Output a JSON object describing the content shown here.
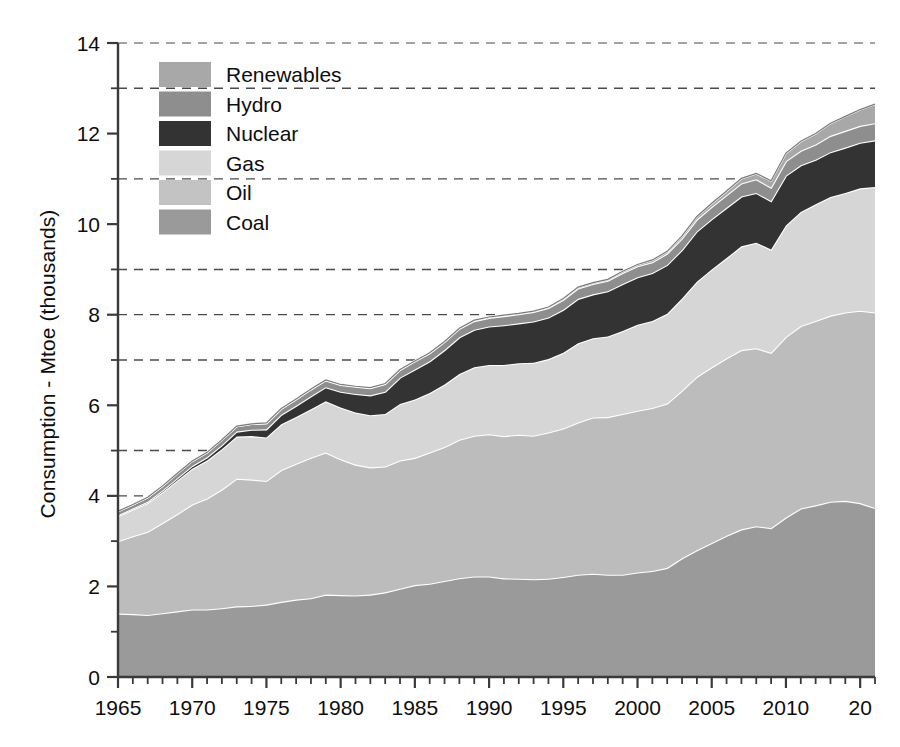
{
  "chart_data": {
    "type": "area",
    "stacked": true,
    "title": "",
    "subtitle": "",
    "xlabel": "",
    "ylabel": "Consumption - Mtoe (thousands)",
    "xlim": [
      1965,
      2016
    ],
    "ylim": [
      0,
      14
    ],
    "y_major_ticks": [
      0,
      2,
      4,
      6,
      8,
      10,
      12,
      14
    ],
    "y_minor_ticks": [
      1,
      3,
      5,
      7,
      9,
      11,
      13
    ],
    "y_tick_labels": [
      "0",
      "2",
      "4",
      "6",
      "8",
      "10",
      "12",
      "14"
    ],
    "x_tick_labels": [
      "1965",
      "1970",
      "1975",
      "1980",
      "1985",
      "1990",
      "1995",
      "2000",
      "2005",
      "2010",
      "20"
    ],
    "x_tick_values": [
      1965,
      1970,
      1975,
      1980,
      1985,
      1990,
      1995,
      2000,
      2005,
      2010,
      2015
    ],
    "x_minor_tick_step": 1,
    "grid": "horizontal-dashed-at-odd-values",
    "legend_position": "upper-left-inside",
    "series_order_bottom_to_top": [
      "Coal",
      "Oil",
      "Gas",
      "Nuclear",
      "Hydro",
      "Renewables"
    ],
    "x": [
      1965,
      1966,
      1967,
      1968,
      1969,
      1970,
      1971,
      1972,
      1973,
      1974,
      1975,
      1976,
      1977,
      1978,
      1979,
      1980,
      1981,
      1982,
      1983,
      1984,
      1985,
      1986,
      1987,
      1988,
      1989,
      1990,
      1991,
      1992,
      1993,
      1994,
      1995,
      1996,
      1997,
      1998,
      1999,
      2000,
      2001,
      2002,
      2003,
      2004,
      2005,
      2006,
      2007,
      2008,
      2009,
      2010,
      2011,
      2012,
      2013,
      2014,
      2015,
      2016
    ],
    "series": [
      {
        "name": "Coal",
        "color": "#9a9a9a",
        "values": [
          1.4,
          1.39,
          1.37,
          1.41,
          1.45,
          1.49,
          1.49,
          1.52,
          1.56,
          1.57,
          1.6,
          1.66,
          1.71,
          1.74,
          1.82,
          1.81,
          1.8,
          1.82,
          1.87,
          1.95,
          2.03,
          2.06,
          2.12,
          2.18,
          2.22,
          2.22,
          2.18,
          2.17,
          2.16,
          2.17,
          2.21,
          2.26,
          2.28,
          2.26,
          2.26,
          2.31,
          2.34,
          2.41,
          2.62,
          2.8,
          2.96,
          3.12,
          3.26,
          3.33,
          3.29,
          3.52,
          3.72,
          3.79,
          3.87,
          3.89,
          3.84,
          3.73
        ],
        "value_range_note": "Mtoe thousands"
      },
      {
        "name": "Oil",
        "color": "#bcbcbc",
        "values": [
          1.6,
          1.72,
          1.84,
          1.99,
          2.15,
          2.32,
          2.45,
          2.62,
          2.82,
          2.79,
          2.73,
          2.91,
          3.0,
          3.1,
          3.14,
          3.0,
          2.89,
          2.81,
          2.78,
          2.83,
          2.81,
          2.9,
          2.96,
          3.06,
          3.11,
          3.14,
          3.14,
          3.18,
          3.17,
          3.23,
          3.28,
          3.36,
          3.45,
          3.48,
          3.55,
          3.57,
          3.6,
          3.63,
          3.7,
          3.83,
          3.88,
          3.92,
          3.96,
          3.93,
          3.87,
          3.99,
          4.03,
          4.07,
          4.11,
          4.16,
          4.25,
          4.32
        ]
      },
      {
        "name": "Gas",
        "color": "#d6d6d6",
        "values": [
          0.55,
          0.59,
          0.63,
          0.68,
          0.74,
          0.79,
          0.84,
          0.89,
          0.93,
          0.96,
          0.96,
          1.01,
          1.03,
          1.07,
          1.13,
          1.14,
          1.15,
          1.15,
          1.16,
          1.25,
          1.29,
          1.31,
          1.38,
          1.45,
          1.51,
          1.53,
          1.57,
          1.58,
          1.61,
          1.62,
          1.67,
          1.75,
          1.75,
          1.78,
          1.83,
          1.9,
          1.92,
          1.98,
          2.04,
          2.1,
          2.16,
          2.21,
          2.29,
          2.33,
          2.28,
          2.46,
          2.52,
          2.58,
          2.62,
          2.64,
          2.7,
          2.77
        ]
      },
      {
        "name": "Nuclear",
        "color": "#333333",
        "values": [
          0.02,
          0.02,
          0.03,
          0.04,
          0.05,
          0.06,
          0.07,
          0.09,
          0.11,
          0.14,
          0.18,
          0.21,
          0.25,
          0.29,
          0.31,
          0.35,
          0.41,
          0.44,
          0.49,
          0.58,
          0.66,
          0.7,
          0.76,
          0.81,
          0.83,
          0.85,
          0.88,
          0.88,
          0.91,
          0.92,
          0.95,
          0.98,
          0.97,
          1.0,
          1.04,
          1.05,
          1.06,
          1.08,
          1.07,
          1.11,
          1.11,
          1.11,
          1.1,
          1.1,
          1.07,
          1.1,
          1.03,
          0.98,
          0.99,
          1.0,
          1.01,
          1.03
        ]
      },
      {
        "name": "Hydro",
        "color": "#8e8e8e",
        "values": [
          0.09,
          0.09,
          0.1,
          0.1,
          0.11,
          0.11,
          0.11,
          0.12,
          0.12,
          0.13,
          0.13,
          0.13,
          0.14,
          0.15,
          0.15,
          0.15,
          0.16,
          0.16,
          0.17,
          0.17,
          0.18,
          0.18,
          0.18,
          0.19,
          0.19,
          0.19,
          0.2,
          0.2,
          0.21,
          0.21,
          0.22,
          0.23,
          0.23,
          0.23,
          0.24,
          0.24,
          0.24,
          0.25,
          0.25,
          0.26,
          0.27,
          0.28,
          0.29,
          0.3,
          0.3,
          0.32,
          0.32,
          0.34,
          0.36,
          0.37,
          0.37,
          0.38
        ]
      },
      {
        "name": "Renewables",
        "color": "#a8a8a8",
        "values": [
          0.0,
          0.0,
          0.0,
          0.0,
          0.0,
          0.0,
          0.0,
          0.0,
          0.0,
          0.0,
          0.01,
          0.01,
          0.01,
          0.01,
          0.01,
          0.01,
          0.01,
          0.01,
          0.01,
          0.01,
          0.01,
          0.01,
          0.01,
          0.01,
          0.02,
          0.02,
          0.02,
          0.02,
          0.02,
          0.02,
          0.03,
          0.03,
          0.03,
          0.03,
          0.04,
          0.04,
          0.05,
          0.05,
          0.06,
          0.07,
          0.08,
          0.09,
          0.11,
          0.13,
          0.15,
          0.18,
          0.21,
          0.24,
          0.28,
          0.32,
          0.36,
          0.42
        ]
      }
    ],
    "legend": [
      {
        "label": "Renewables",
        "color": "#a8a8a8"
      },
      {
        "label": "Hydro",
        "color": "#8e8e8e"
      },
      {
        "label": "Nuclear",
        "color": "#333333"
      },
      {
        "label": "Gas",
        "color": "#d6d6d6"
      },
      {
        "label": "Oil",
        "color": "#c3c3c3"
      },
      {
        "label": "Coal",
        "color": "#9a9a9a"
      }
    ],
    "style": {
      "boundary_line_color": "#ffffff",
      "axis_color": "#3a3a3a",
      "grid_color": "#4a4a4a",
      "background": "#ffffff"
    }
  }
}
